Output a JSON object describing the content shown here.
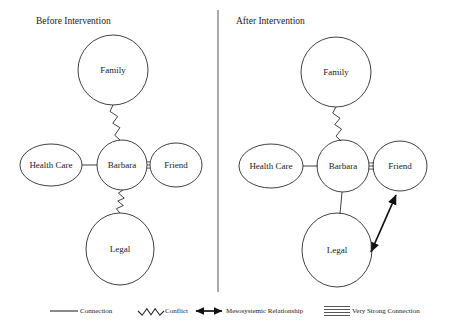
{
  "figure": {
    "type": "ecomap-diagram",
    "divider": {
      "x": 218,
      "y1": 10,
      "y2": 292
    }
  },
  "panels": [
    {
      "id": "before",
      "title": "Before Intervention",
      "title_pos": {
        "x": 36,
        "y": 24
      },
      "nodes": [
        {
          "id": "family",
          "label": "Family",
          "cx": 113,
          "cy": 70,
          "rx": 35,
          "ry": 35
        },
        {
          "id": "health_care",
          "label": "Health Care",
          "cx": 51,
          "cy": 165,
          "rx": 31,
          "ry": 21
        },
        {
          "id": "barbara",
          "label": "Barbara",
          "cx": 122,
          "cy": 165,
          "rx": 25,
          "ry": 25
        },
        {
          "id": "friend",
          "label": "Friend",
          "cx": 176,
          "cy": 165,
          "rx": 26,
          "ry": 22
        },
        {
          "id": "legal",
          "label": "Legal",
          "cx": 120,
          "cy": 249,
          "rx": 34,
          "ry": 36
        }
      ],
      "edges": [
        {
          "from": "family",
          "to": "barbara",
          "kind": "conflict",
          "x1": 113,
          "y1": 105,
          "x2": 120,
          "y2": 140
        },
        {
          "from": "health_care",
          "to": "barbara",
          "kind": "connection",
          "x1": 82,
          "y1": 165,
          "x2": 97,
          "y2": 165
        },
        {
          "from": "barbara",
          "to": "friend",
          "kind": "very-strong-connection",
          "x1": 147,
          "y1": 165,
          "x2": 150,
          "y2": 165
        },
        {
          "from": "barbara",
          "to": "legal",
          "kind": "conflict",
          "x1": 123,
          "y1": 190,
          "x2": 120,
          "y2": 213
        }
      ]
    },
    {
      "id": "after",
      "title": "After Intervention",
      "title_pos": {
        "x": 236,
        "y": 24
      },
      "nodes": [
        {
          "id": "family",
          "label": "Family",
          "cx": 336,
          "cy": 72,
          "rx": 35,
          "ry": 35
        },
        {
          "id": "health_care",
          "label": "Health Care",
          "cx": 271,
          "cy": 166,
          "rx": 32,
          "ry": 22
        },
        {
          "id": "barbara",
          "label": "Barbara",
          "cx": 343,
          "cy": 166,
          "rx": 26,
          "ry": 26
        },
        {
          "id": "friend",
          "label": "Friend",
          "cx": 400,
          "cy": 166,
          "rx": 27,
          "ry": 25
        },
        {
          "id": "legal",
          "label": "Legal",
          "cx": 337,
          "cy": 250,
          "rx": 35,
          "ry": 37
        }
      ],
      "edges": [
        {
          "from": "family",
          "to": "barbara",
          "kind": "conflict",
          "x1": 336,
          "y1": 107,
          "x2": 341,
          "y2": 141
        },
        {
          "from": "health_care",
          "to": "barbara",
          "kind": "connection",
          "x1": 303,
          "y1": 166,
          "x2": 318,
          "y2": 166
        },
        {
          "from": "barbara",
          "to": "friend",
          "kind": "very-strong-connection",
          "x1": 369,
          "y1": 166,
          "x2": 374,
          "y2": 166
        },
        {
          "from": "barbara",
          "to": "legal",
          "kind": "connection",
          "x1": 342,
          "y1": 192,
          "x2": 340,
          "y2": 214
        },
        {
          "from": "legal",
          "to": "friend",
          "kind": "mesosystemic",
          "x1": 371,
          "y1": 252,
          "x2": 396,
          "y2": 195
        }
      ]
    }
  ],
  "legend": {
    "items": [
      {
        "id": "connection",
        "symbol": "straight-line",
        "label": "Connection",
        "sym_x": 50,
        "sym_y": 311,
        "sym_w": 28,
        "text_x": 80,
        "text_y": 311
      },
      {
        "id": "conflict",
        "symbol": "zigzag-line",
        "label": "Conflict",
        "sym_x": 138,
        "sym_y": 311,
        "sym_w": 26,
        "text_x": 165,
        "text_y": 311
      },
      {
        "id": "mesosystemic",
        "symbol": "double-headed-arrow",
        "label": "Mesosystemic  Relationship",
        "sym_x": 196,
        "sym_y": 311,
        "sym_w": 26,
        "text_x": 226,
        "text_y": 311
      },
      {
        "id": "very-strong-connection",
        "symbol": "quadruple-line",
        "label": "Very Strong Connection",
        "sym_x": 324,
        "sym_y": 311,
        "sym_w": 26,
        "text_x": 352,
        "text_y": 311
      }
    ]
  },
  "colors": {
    "stroke": "#2b2b2b",
    "text": "#1a1a1a",
    "background": "#ffffff",
    "arrow": "#111111",
    "divider": "#555555"
  }
}
